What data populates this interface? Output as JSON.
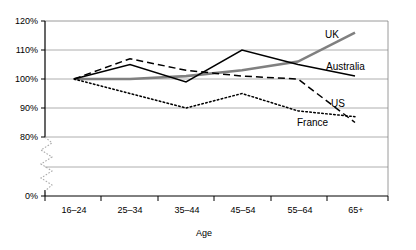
{
  "chart_data": {
    "type": "line",
    "title": "",
    "xlabel": "Age",
    "ylabel": "",
    "categories": [
      "16–24",
      "25–34",
      "35–44",
      "45–54",
      "55–64",
      "65+"
    ],
    "ytick_labels": [
      "120%",
      "110%",
      "100%",
      "90%",
      "80%",
      "0%"
    ],
    "ytick_values": [
      120,
      110,
      100,
      90,
      80,
      0
    ],
    "ylim": [
      80,
      120
    ],
    "axis_break": true,
    "grid": "horizontal",
    "legend_position": "inline-right",
    "series": [
      {
        "name": "UK",
        "style": "solid-grey",
        "color": "#808080",
        "values": [
          100,
          100,
          101,
          103,
          106,
          116
        ]
      },
      {
        "name": "Australia",
        "style": "solid-black",
        "color": "#000000",
        "values": [
          100,
          105,
          99,
          110,
          105,
          101
        ]
      },
      {
        "name": "US",
        "style": "dashed-black",
        "color": "#000000",
        "values": [
          100,
          107,
          103,
          101,
          100,
          85
        ]
      },
      {
        "name": "France",
        "style": "dotted-black",
        "color": "#000000",
        "values": [
          100,
          95,
          90,
          95,
          89,
          87
        ]
      }
    ]
  },
  "labels": {
    "uk": "UK",
    "australia": "Australia",
    "us": "US",
    "france": "France",
    "age_axis": "Age"
  }
}
